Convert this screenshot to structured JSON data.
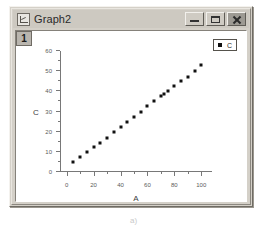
{
  "window": {
    "title": "Graph2",
    "icon": "graph-document-icon",
    "controls": {
      "minimize_label": "–",
      "maximize_label": "□",
      "close_label": "✕"
    }
  },
  "page": {
    "layer_indicator": "1"
  },
  "legend": {
    "entries": [
      {
        "label": "C",
        "marker": "square",
        "color": "#111111"
      }
    ]
  },
  "caption": "a)",
  "chart_data": {
    "type": "scatter",
    "title": "",
    "xlabel": "A",
    "ylabel": "C",
    "xlim": [
      -5,
      108
    ],
    "ylim": [
      0,
      60
    ],
    "xticks": [
      0,
      20,
      40,
      60,
      80,
      100
    ],
    "yticks": [
      0,
      10,
      20,
      30,
      40,
      50,
      60
    ],
    "xtick_labels": [
      "0",
      "20",
      "40",
      "60",
      "80",
      "100"
    ],
    "ytick_labels": [
      "0",
      "10",
      "20",
      "30",
      "40",
      "50",
      "60"
    ],
    "grid": false,
    "legend_position": "top-right",
    "series": [
      {
        "name": "C",
        "marker": "square",
        "color": "#111111",
        "points": [
          [
            5,
            5
          ],
          [
            10,
            7.5
          ],
          [
            15,
            10
          ],
          [
            20,
            12.5
          ],
          [
            25,
            14.5
          ],
          [
            30,
            17
          ],
          [
            35,
            20
          ],
          [
            40,
            22.5
          ],
          [
            45,
            25
          ],
          [
            50,
            27.5
          ],
          [
            55,
            30
          ],
          [
            60,
            32.5
          ],
          [
            65,
            35
          ],
          [
            70,
            37.5
          ],
          [
            72,
            38.5
          ],
          [
            75,
            40
          ],
          [
            80,
            42.5
          ],
          [
            85,
            45
          ],
          [
            90,
            47
          ],
          [
            95,
            50
          ],
          [
            100,
            53
          ]
        ]
      }
    ]
  }
}
